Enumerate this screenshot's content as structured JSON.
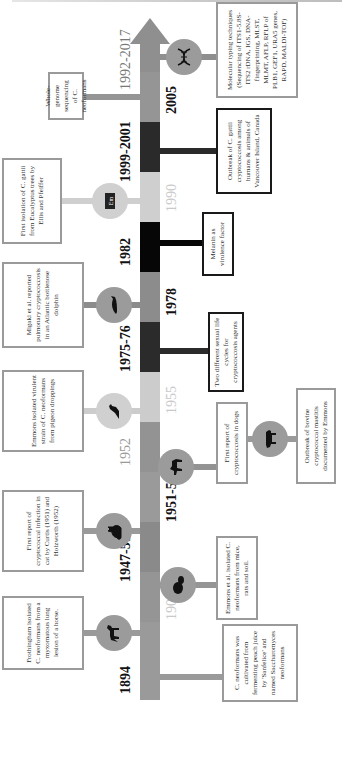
{
  "colors": {
    "axis_gray": "#8f8f8f",
    "axis_mid": "#999999",
    "axis_light": "#cfcfcf",
    "axis_dark": "#2a2a2a",
    "axis_black": "#050505",
    "box_border_gray": "#9a9a9a",
    "box_border_dark": "#1a1a1a",
    "circle_gray": "#9b9b9b"
  },
  "timeline": {
    "orientation": "rotated 90 degrees counter-clockwise; time runs bottom to top",
    "years_above": [
      {
        "label": "1894",
        "style": "bold"
      },
      {
        "label": "1947-51",
        "style": "bold"
      },
      {
        "label": "1952",
        "style": "light"
      },
      {
        "label": "1975-76",
        "style": "bold"
      },
      {
        "label": "1982",
        "style": "bold"
      },
      {
        "label": "1999-2001",
        "style": "bold"
      },
      {
        "label": "1992-2017",
        "style": "light-gray"
      }
    ],
    "years_below": [
      {
        "label": "1902",
        "style": "light"
      },
      {
        "label": "1951-52",
        "style": "bold"
      },
      {
        "label": "1955",
        "style": "light"
      },
      {
        "label": "1978",
        "style": "bold"
      },
      {
        "label": "1990",
        "style": "light"
      },
      {
        "label": "2005",
        "style": "bold"
      }
    ]
  },
  "events_above": [
    {
      "year": "1894",
      "icon": "horse-icon",
      "text": "Frothingham isolated C. neoformans from a myxomatous lung lesion of a horse."
    },
    {
      "year": "1947-51",
      "icon": "cat-icon",
      "text": "First report of cryptococcal infection in cat by Curtis (1951) and Holzworth (1952)"
    },
    {
      "year": "1955",
      "icon": "pigeon-icon",
      "text": "Emmons isolated virulent strain of C. neoformans from pigeon droppings"
    },
    {
      "year": "1978",
      "icon": "dolphin-icon",
      "text": "Migaki et al. reported pulmonary cryptococcosis in an Atlantic bottlenose dolphin"
    },
    {
      "year": "1990",
      "icon": "book-icon",
      "icon_label": "Em",
      "text": "First isolation of C. gattii from Eucalyptus trees by Ellis and Pfeiffer"
    },
    {
      "year": "2005",
      "icon": null,
      "text": "Whole-genome sequencing of C. neoformans"
    }
  ],
  "events_below": [
    {
      "year": "1894",
      "icon": null,
      "text": "C. neoformans was cultivated from fermenting peach juice by 'Sanfelice' and named Saccharomyces neoformans"
    },
    {
      "year": "1951-52",
      "icon": "rodent-icon",
      "text": "Emmons et al. isolated C. neoformans from mice, rats and soil."
    },
    {
      "year": "1952",
      "icon": "dog-icon",
      "text": "First report of cryptococcosis in dogs"
    },
    {
      "year": "1952b",
      "icon": "cow-icon",
      "text": "Outbreak of bovine cryptococcal mastitis documented by Emmons"
    },
    {
      "year": "1975-76",
      "icon": null,
      "text": "Two different sexual life cycles for cryptococcosis agents"
    },
    {
      "year": "1982",
      "icon": null,
      "text": "Melanin as virulence factor"
    },
    {
      "year": "1999-2001",
      "icon": null,
      "text": "Outbreak of C. gattii cryptococcosis among humans & animals of Vancouver Island, Canada"
    },
    {
      "year": "1992-2017",
      "icon": "dna-icon",
      "text": "Molecular typing techniques (Sequencing of ITS1-5.8S-ITS2 rDNA, IGS, DNA-fingerprinting, MLST, MLMT, AFLP, RFLP of PLB1, GEF1, URA5 genes, RAPD, MALDI-TOF)"
    }
  ]
}
